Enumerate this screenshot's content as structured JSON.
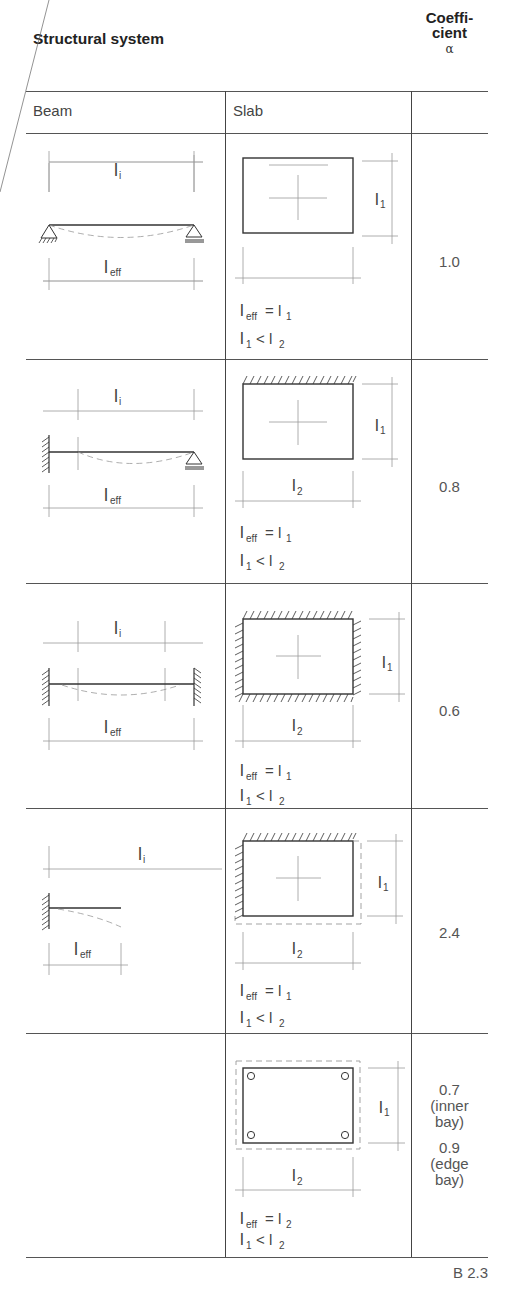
{
  "header": {
    "title": "Structural system",
    "coefficient_label_line1": "Coeffi-",
    "coefficient_label_line2": "cient",
    "coefficient_symbol": "α"
  },
  "columns": {
    "beam": "Beam",
    "slab": "Slab"
  },
  "rows": [
    {
      "beam": {
        "span_label": "l",
        "span_sub": "i",
        "eff_label": "l",
        "eff_sub": "eff",
        "supports": "pinned-roller"
      },
      "slab": {
        "edges": "simply supported",
        "dim_side": "l1",
        "dim_bottom": "",
        "eq1": "l_eff = l_1",
        "eq2": "l_1 < l_2"
      },
      "coefficient": "1.0"
    },
    {
      "beam": {
        "span_label": "l",
        "span_sub": "i",
        "eff_label": "l",
        "eff_sub": "eff",
        "supports": "fixed-roller"
      },
      "slab": {
        "edges": "one edge fixed",
        "dim_side": "l1",
        "dim_bottom": "l2",
        "eq1": "l_eff = l_1",
        "eq2": "l_1 < l_2"
      },
      "coefficient": "0.8"
    },
    {
      "beam": {
        "span_label": "l",
        "span_sub": "i",
        "eff_label": "l",
        "eff_sub": "eff",
        "supports": "fixed-fixed"
      },
      "slab": {
        "edges": "all edges fixed",
        "dim_side": "l1",
        "dim_bottom": "l2",
        "eq1": "l_eff = l_1",
        "eq2": "l_1 < l_2"
      },
      "coefficient": "0.6"
    },
    {
      "beam": {
        "span_label": "l",
        "span_sub": "i",
        "eff_label": "l",
        "eff_sub": "eff",
        "supports": "cantilever"
      },
      "slab": {
        "edges": "two edges fixed, two free",
        "dim_side": "l1",
        "dim_bottom": "l2",
        "eq1": "l_eff = l_1",
        "eq2": "l_1 < l_2"
      },
      "coefficient": "2.4"
    },
    {
      "beam": null,
      "slab": {
        "edges": "flat slab on point supports",
        "dim_side": "l1",
        "dim_bottom": "l2",
        "eq1": "l_eff = l_2",
        "eq2": "l_1 < l_2"
      },
      "coefficient_lines": [
        "0.7",
        "(inner",
        "bay)",
        "0.9",
        "(edge",
        "bay)"
      ]
    }
  ],
  "text": {
    "l": "l",
    "sub_i": "i",
    "sub_eff": "eff",
    "sub_1": "1",
    "sub_2": "2",
    "eq": "=",
    "lt": "<"
  },
  "figure_ref": "B 2.3"
}
